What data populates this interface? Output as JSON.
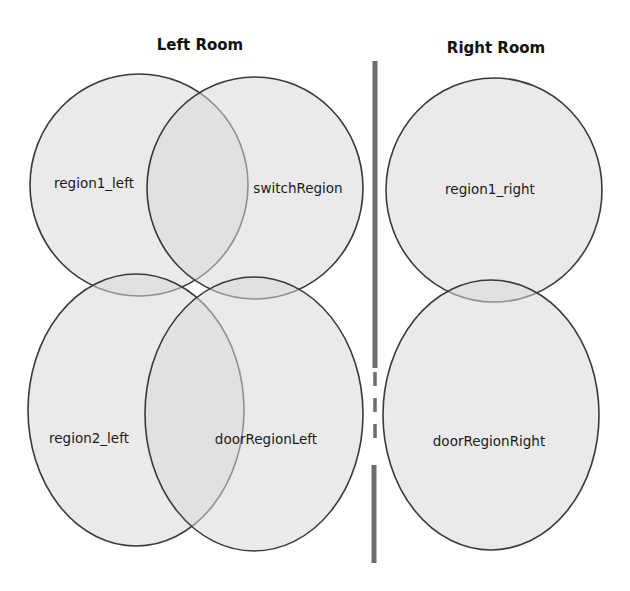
{
  "diagram": {
    "rooms": [
      {
        "id": "left",
        "title": "Left Room",
        "title_pos": {
          "x": 200,
          "y": 50
        }
      },
      {
        "id": "right",
        "title": "Right Room",
        "title_pos": {
          "x": 496,
          "y": 53
        }
      }
    ],
    "regions": [
      {
        "id": "region1_left",
        "label": "region1_left",
        "room": "left",
        "cx": 139,
        "cy": 185,
        "rx": 109,
        "ry": 111,
        "label_x": 94,
        "label_y": 183
      },
      {
        "id": "switchRegion",
        "label": "switchRegion",
        "room": "left",
        "cx": 255,
        "cy": 188,
        "rx": 108,
        "ry": 111,
        "label_x": 298,
        "label_y": 188
      },
      {
        "id": "region2_left",
        "label": "region2_left",
        "room": "left",
        "cx": 136,
        "cy": 410,
        "rx": 108,
        "ry": 136,
        "label_x": 89,
        "label_y": 439
      },
      {
        "id": "doorRegionLeft",
        "label": "doorRegionLeft",
        "room": "left",
        "cx": 254,
        "cy": 414,
        "rx": 109,
        "ry": 137,
        "label_x": 266,
        "label_y": 440
      },
      {
        "id": "region1_right",
        "label": "region1_right",
        "room": "right",
        "cx": 494,
        "cy": 190,
        "rx": 108,
        "ry": 112,
        "label_x": 490,
        "label_y": 190
      },
      {
        "id": "doorRegionRight",
        "label": "doorRegionRight",
        "room": "right",
        "cx": 491,
        "cy": 415,
        "rx": 108,
        "ry": 135,
        "label_x": 489,
        "label_y": 443
      }
    ],
    "wall": {
      "x": 375,
      "solid_top": {
        "y1": 61,
        "y2": 368
      },
      "door_gap_dashed": {
        "y1": 372,
        "y2": 446
      },
      "solid_bottom": {
        "y1": 465,
        "y2": 563
      }
    },
    "colors": {
      "region_fill": "#d9d9d9",
      "region_stroke": "#3a3a3a",
      "wall": "#6e6e6e",
      "background": "#ffffff"
    }
  }
}
